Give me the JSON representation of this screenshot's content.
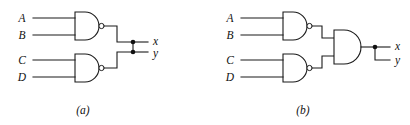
{
  "figure": {
    "background_color": "#ffffff",
    "line_color": "#1a1a1a",
    "panels": [
      {
        "id": "a",
        "caption": "(a)",
        "description": "Two NAND gates with outputs tied together to a common node producing x and y",
        "inputs": [
          "A",
          "B",
          "C",
          "D"
        ],
        "outputs": [
          "x",
          "y"
        ],
        "gates": [
          {
            "name": "nand-gate-ab",
            "type": "NAND",
            "inputs": [
              "A",
              "B"
            ]
          },
          {
            "name": "nand-gate-cd",
            "type": "NAND",
            "inputs": [
              "C",
              "D"
            ]
          }
        ],
        "junction_count": 2
      },
      {
        "id": "b",
        "caption": "(b)",
        "description": "Two NAND gates feeding an AND gate whose output fans out to x and y",
        "inputs": [
          "A",
          "B",
          "C",
          "D"
        ],
        "outputs": [
          "x",
          "y"
        ],
        "gates": [
          {
            "name": "nand-gate-ab",
            "type": "NAND",
            "inputs": [
              "A",
              "B"
            ]
          },
          {
            "name": "nand-gate-cd",
            "type": "NAND",
            "inputs": [
              "C",
              "D"
            ]
          },
          {
            "name": "and-gate-out",
            "type": "AND",
            "inputs": [
              "nand-gate-ab",
              "nand-gate-cd"
            ]
          }
        ],
        "junction_count": 1
      }
    ]
  },
  "panel_a": {
    "label_A": "A",
    "label_B": "B",
    "label_C": "C",
    "label_D": "D",
    "label_x": "x",
    "label_y": "y",
    "caption": "(a)"
  },
  "panel_b": {
    "label_A": "A",
    "label_B": "B",
    "label_C": "C",
    "label_D": "D",
    "label_x": "x",
    "label_y": "y",
    "caption": "(b)"
  }
}
